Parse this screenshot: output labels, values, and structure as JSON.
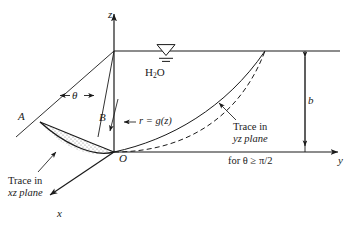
{
  "figure": {
    "background": "#ffffff",
    "ink": "#1a1a1a",
    "shade_fill": "#d9d9d9"
  },
  "axes": {
    "z": {
      "label": "z",
      "direction": "up",
      "origin_label": "O"
    },
    "y": {
      "label": "y",
      "direction": "right"
    },
    "x": {
      "label": "x",
      "direction": "down-left"
    },
    "origin": {
      "label": "O"
    }
  },
  "labels": {
    "point_a": "A",
    "point_b": "B",
    "angle": "θ",
    "fluid": {
      "formula": "H",
      "subscript": "2",
      "tail": "O"
    },
    "radius_function": "r = g(z)",
    "depth": "b",
    "trace_yz_line1": "Trace in",
    "trace_yz_line2": "yz plane",
    "trace_xz_line1": "Trace in",
    "trace_xz_line2": "xz plane",
    "condition": "for θ ≥ π/2"
  },
  "icons": {
    "water_surface": "water-level-triangle-icon",
    "z_arrow": "axis-arrow-up-icon",
    "y_arrow": "axis-arrow-right-icon",
    "x_arrow": "axis-arrow-down-left-icon",
    "dimension_arrow": "double-headed-dimension-arrow-icon",
    "angle_arrows": "angle-double-arrow-icon"
  },
  "geometry": {
    "origin": [
      114,
      152
    ],
    "z_axis_top": [
      114,
      12
    ],
    "surface_level_y": 51,
    "surface_right_x": 340,
    "y_axis_right_x": 340,
    "b_dimension_x": 305,
    "point_a": [
      40,
      122
    ],
    "point_b": [
      106,
      124
    ],
    "yz_trace_end": [
      265,
      51
    ],
    "x_axis_end": [
      48,
      196
    ]
  }
}
